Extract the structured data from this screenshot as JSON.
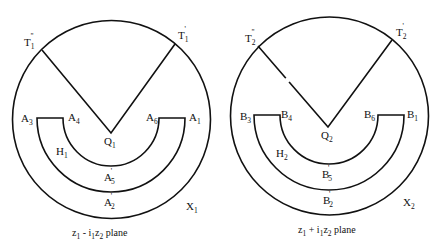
{
  "diagram": {
    "panels": [
      {
        "id": "left",
        "circle_label": "X",
        "circle_label_sub": "1",
        "vertex_label": "Q",
        "vertex_label_sub": "1",
        "region_label": "H",
        "region_label_sub": "1",
        "ray_left_label": "T",
        "ray_left_label_sub": "1",
        "ray_left_label_sup": "\"",
        "ray_right_label": "T",
        "ray_right_label_sub": "1",
        "ray_right_label_sup": "'",
        "corner_labels": [
          {
            "base": "A",
            "sub": "3"
          },
          {
            "base": "A",
            "sub": "4"
          },
          {
            "base": "A",
            "sub": "6"
          },
          {
            "base": "A",
            "sub": "1"
          }
        ],
        "inner_arc_label": {
          "base": "A",
          "sub": "5",
          "sup": "'"
        },
        "outer_arc_label": {
          "base": "A",
          "sub": "2",
          "sup": "'"
        },
        "caption": {
          "a": "z",
          "a_sub": "1",
          "op": " - ",
          "b": "i",
          "b_sub": "1",
          "c": "z",
          "c_sub": "2",
          "tail": "  plane"
        }
      },
      {
        "id": "right",
        "circle_label": "X",
        "circle_label_sub": "2",
        "vertex_label": "Q",
        "vertex_label_sub": "2",
        "region_label": "H",
        "region_label_sub": "2",
        "ray_left_label": "T",
        "ray_left_label_sub": "2",
        "ray_left_label_sup": "\"",
        "ray_right_label": "T",
        "ray_right_label_sub": "2",
        "ray_right_label_sup": "'",
        "corner_labels": [
          {
            "base": "B",
            "sub": "3"
          },
          {
            "base": "B",
            "sub": "4"
          },
          {
            "base": "B",
            "sub": "6"
          },
          {
            "base": "B",
            "sub": "1"
          }
        ],
        "inner_arc_label": {
          "base": "B",
          "sub": "5",
          "sup": "'"
        },
        "outer_arc_label": {
          "base": "B",
          "sub": "2",
          "sup": "'"
        },
        "caption": {
          "a": "z",
          "a_sub": "1",
          "op": " + ",
          "b": "i",
          "b_sub": "1",
          "c": "z",
          "c_sub": "2",
          "tail": "  plane"
        }
      }
    ]
  }
}
